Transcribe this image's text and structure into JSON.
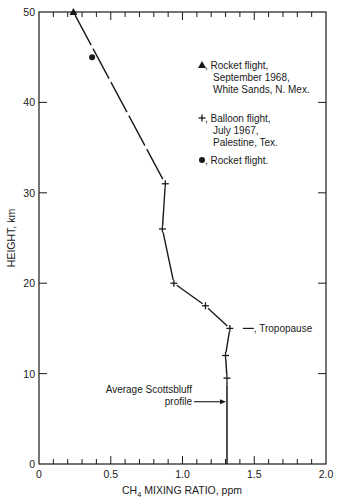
{
  "chart_data": {
    "type": "line",
    "title": "",
    "xlabel": "CH4 MIXING RATIO, ppm",
    "xlabel_main": "CH",
    "xlabel_sub": "4",
    "xlabel_rest": " MIXING RATIO, ppm",
    "ylabel": "HEIGHT, km",
    "xlim": [
      0,
      2.0
    ],
    "ylim": [
      0,
      50
    ],
    "x_ticks": [
      "0",
      "0.5",
      "1.0",
      "1.5",
      "2.0"
    ],
    "y_ticks": [
      "0",
      "10",
      "20",
      "30",
      "40",
      "50"
    ],
    "grid": false,
    "legend_position": "upper right (inside)",
    "series": [
      {
        "name": "Rocket flight, September 1968, White Sands, N. Mex.",
        "marker": "triangle",
        "points": [
          {
            "x": 0.24,
            "y": 50
          }
        ]
      },
      {
        "name": "Rocket flight.",
        "marker": "circle",
        "points": [
          {
            "x": 0.37,
            "y": 45
          }
        ]
      },
      {
        "name": "Balloon flight, July 1967, Palestine, Tex.",
        "marker": "plus",
        "points": [
          {
            "x": 0.88,
            "y": 31
          },
          {
            "x": 0.86,
            "y": 26
          },
          {
            "x": 0.94,
            "y": 20
          },
          {
            "x": 1.16,
            "y": 17.5
          },
          {
            "x": 1.33,
            "y": 15
          },
          {
            "x": 1.3,
            "y": 12
          },
          {
            "x": 1.31,
            "y": 9.5
          }
        ]
      },
      {
        "name": "Average Scottsbluff profile",
        "marker": "none",
        "points": [
          {
            "x": 1.31,
            "y": 8.8
          },
          {
            "x": 1.31,
            "y": 0
          }
        ]
      }
    ],
    "profile_line": [
      {
        "x": 0.24,
        "y": 50
      },
      {
        "x": 0.88,
        "y": 31
      },
      {
        "x": 0.86,
        "y": 26
      },
      {
        "x": 0.94,
        "y": 20
      },
      {
        "x": 1.16,
        "y": 17.5
      },
      {
        "x": 1.33,
        "y": 15
      },
      {
        "x": 1.3,
        "y": 12
      },
      {
        "x": 1.31,
        "y": 9.5
      },
      {
        "x": 1.31,
        "y": 8.8
      }
    ],
    "annotations": [
      {
        "text": ", Tropopause",
        "x": 1.33,
        "y": 15
      },
      {
        "text": "Average Scottsbluff",
        "line": 1
      },
      {
        "text": "profile",
        "line": 2,
        "arrow_to": {
          "x": 1.31,
          "y": 7
        }
      }
    ],
    "legend": [
      {
        "symbol": "▲",
        "lines": [
          ", Rocket flight,",
          "September 1968,",
          "White Sands, N. Mex."
        ]
      },
      {
        "symbol": "+",
        "lines": [
          ", Balloon flight,",
          "July 1967,",
          "Palestine, Tex."
        ]
      },
      {
        "symbol": "●",
        "lines": [
          ", Rocket flight."
        ]
      }
    ]
  },
  "colors": {
    "ink": "#1a1a1a",
    "background": "#ffffff"
  }
}
